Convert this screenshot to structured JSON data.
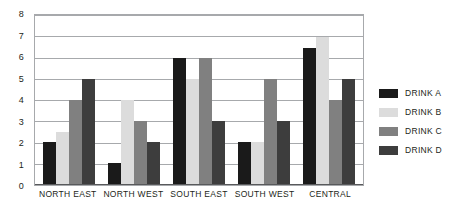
{
  "chart_data": {
    "type": "bar",
    "title": "",
    "subtitle": "",
    "xlabel": "",
    "ylabel": "",
    "categories": [
      "NORTH EAST",
      "NORTH WEST",
      "SOUTH EAST",
      "SOUTH WEST",
      "CENTRAL"
    ],
    "series": [
      {
        "name": "DRINK A",
        "color": "#1a1a1a",
        "values": [
          2,
          1,
          6,
          2,
          6.5
        ]
      },
      {
        "name": "DRINK B",
        "color": "#dcdcdc",
        "values": [
          2.5,
          4,
          5,
          2,
          7
        ]
      },
      {
        "name": "DRINK C",
        "color": "#808080",
        "values": [
          4,
          3,
          6,
          5,
          4
        ]
      },
      {
        "name": "DRINK D",
        "color": "#3d3d3d",
        "values": [
          5,
          2,
          3,
          3,
          5
        ]
      }
    ],
    "ylim": [
      0,
      8
    ],
    "ytick_labels": [
      "0",
      "1",
      "2",
      "3",
      "4",
      "5",
      "6",
      "7",
      "8"
    ],
    "ytick_values": [
      0,
      1,
      2,
      3,
      4,
      5,
      6,
      7,
      8
    ],
    "grid": true,
    "grid_color": "#a7a9ac",
    "legend_position": "right",
    "background_color": "#ffffff",
    "axis_color": "#58595b",
    "text_color": "#231f20"
  },
  "legend": {
    "items": [
      {
        "label": "DRINK A",
        "color": "#1a1a1a"
      },
      {
        "label": "DRINK B",
        "color": "#dcdcdc"
      },
      {
        "label": "DRINK C",
        "color": "#808080"
      },
      {
        "label": "DRINK D",
        "color": "#3d3d3d"
      }
    ]
  }
}
